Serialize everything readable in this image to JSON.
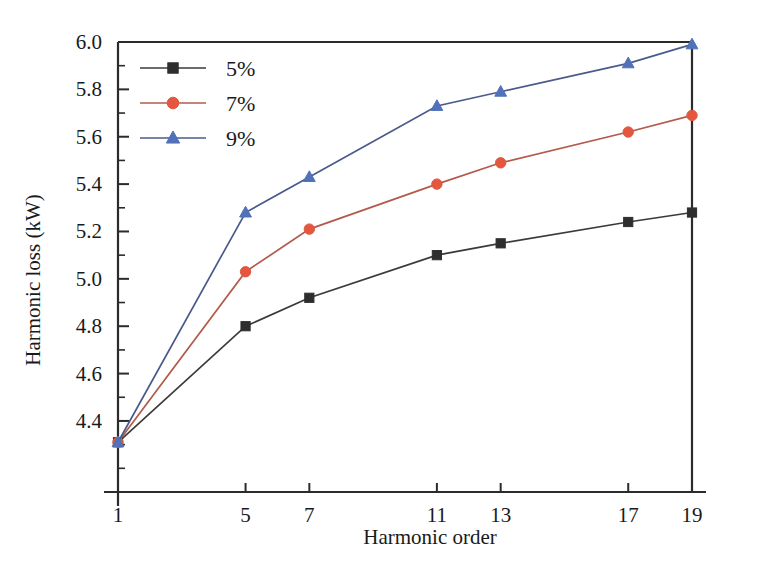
{
  "chart_data": {
    "type": "line",
    "title": "",
    "subtitle": "",
    "xlabel": "Harmonic order",
    "ylabel": "Harmonic loss (kW)",
    "x": [
      1,
      5,
      7,
      11,
      13,
      17,
      19
    ],
    "xtick_labels": [
      "1",
      "5",
      "7",
      "11",
      "13",
      "17",
      "19"
    ],
    "xlim": [
      1,
      19
    ],
    "ylim": [
      4.1,
      6.0
    ],
    "ytick_labels": [
      "4.4",
      "4.6",
      "4.8",
      "5.0",
      "5.2",
      "5.4",
      "5.6",
      "5.8",
      "6.0"
    ],
    "ytick_values": [
      4.4,
      4.6,
      4.8,
      5.0,
      5.2,
      5.4,
      5.6,
      5.8,
      6.0
    ],
    "yminor_step": 0.1,
    "grid": false,
    "legend_position": "top-left",
    "series": [
      {
        "name": "5%",
        "color": "#2e2e2e",
        "marker": "square",
        "values": [
          4.31,
          4.8,
          4.92,
          5.1,
          5.15,
          5.24,
          5.28
        ]
      },
      {
        "name": "7%",
        "color": "#e2573d",
        "marker": "circle",
        "values": [
          4.31,
          5.03,
          5.21,
          5.4,
          5.49,
          5.62,
          5.69
        ]
      },
      {
        "name": "9%",
        "color": "#5171b8",
        "marker": "triangle",
        "values": [
          4.31,
          5.28,
          5.43,
          5.73,
          5.79,
          5.91,
          5.99
        ]
      }
    ]
  },
  "legend": {
    "entries": [
      {
        "label": "5%"
      },
      {
        "label": "7%"
      },
      {
        "label": "9%"
      }
    ]
  },
  "axes": {
    "x_title": "Harmonic order",
    "y_title": "Harmonic loss (kW)"
  }
}
